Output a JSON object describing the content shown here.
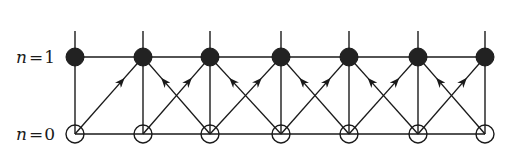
{
  "diagram": {
    "type": "lattice-transition-diagram",
    "levels": [
      {
        "name": "n1",
        "label_var": "n",
        "label_eq": "=",
        "label_val": "1",
        "y": 57,
        "node_style": "filled"
      },
      {
        "name": "n0",
        "label_var": "n",
        "label_eq": "=",
        "label_val": "0",
        "y": 134,
        "node_style": "open"
      }
    ],
    "node_x": [
      75,
      143,
      210,
      281,
      349,
      418,
      485
    ],
    "node_radius": 9,
    "stub_top_y": 31,
    "colors": {
      "line": "#1a1a1a",
      "filled_node": "#222222",
      "open_node_fill": "#ffffff",
      "background": "#ffffff"
    },
    "arrows": [
      {
        "from": [
          0,
          "n0"
        ],
        "to": [
          1,
          "n1"
        ]
      },
      {
        "from": [
          1,
          "n0"
        ],
        "to": [
          2,
          "n1"
        ]
      },
      {
        "from": [
          2,
          "n0"
        ],
        "to": [
          1,
          "n1"
        ]
      },
      {
        "from": [
          2,
          "n0"
        ],
        "to": [
          3,
          "n1"
        ]
      },
      {
        "from": [
          3,
          "n0"
        ],
        "to": [
          2,
          "n1"
        ]
      },
      {
        "from": [
          3,
          "n0"
        ],
        "to": [
          4,
          "n1"
        ]
      },
      {
        "from": [
          4,
          "n0"
        ],
        "to": [
          3,
          "n1"
        ]
      },
      {
        "from": [
          4,
          "n0"
        ],
        "to": [
          5,
          "n1"
        ]
      },
      {
        "from": [
          5,
          "n0"
        ],
        "to": [
          4,
          "n1"
        ]
      },
      {
        "from": [
          5,
          "n0"
        ],
        "to": [
          6,
          "n1"
        ]
      },
      {
        "from": [
          6,
          "n0"
        ],
        "to": [
          5,
          "n1"
        ]
      }
    ]
  }
}
